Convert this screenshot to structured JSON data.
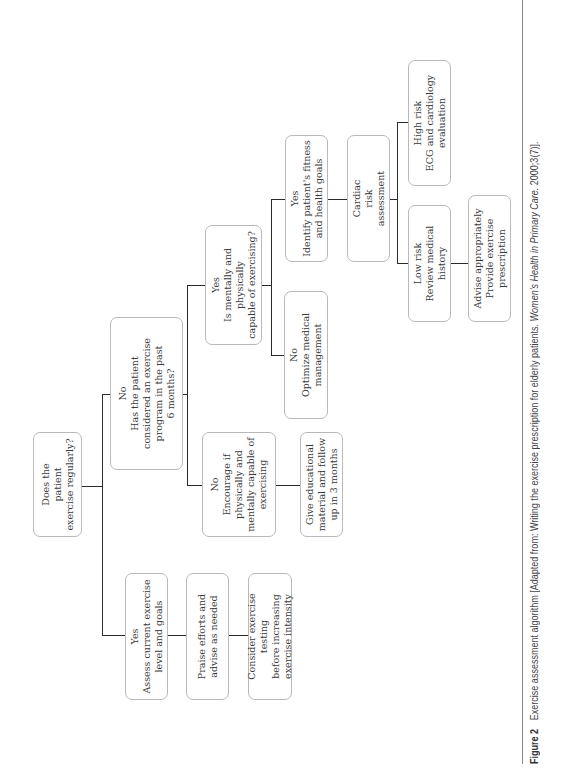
{
  "figure": {
    "label": "Figure 2",
    "caption_prefix": "Exercise assessment algorithm [Adapted from: Writing the exercise prescription for elderly patients. ",
    "caption_journal": "Women's Health in Primary Care.",
    "caption_suffix": " 2000;3(7)]."
  },
  "nodes": {
    "start": "Does the\npatient\nexercise regularly?",
    "yes_assess": "Yes\nAssess current exercise\nlevel and goals",
    "praise": "Praise efforts and\nadvise as needed",
    "consider": "Consider exercise testing\nbefore increasing\nexercise intensity",
    "no_considered": "No\nHas the patient\nconsidered an exercise\nprogram in the past\n6 months?",
    "no_encourage": "No\nEncourage if\nphysically and\nmentally capable of\nexercising",
    "give_material": "Give educational\nmaterial and follow\nup in 3 months",
    "yes_capable": "Yes\nIs mentally and physically\ncapable of exercising?",
    "no_optimize": "No\nOptimize medical\nmanagement",
    "yes_identify": "Yes\nIdentify patient's fitness\nand health goals",
    "cardiac": "Cardiac\nrisk\nassessment",
    "low_risk": "Low risk\nReview medical\nhistory",
    "high_risk": "High risk\nECG and cardiology\nevaluation",
    "advise": "Advise appropriately\nProvide exercise\nprescription"
  }
}
